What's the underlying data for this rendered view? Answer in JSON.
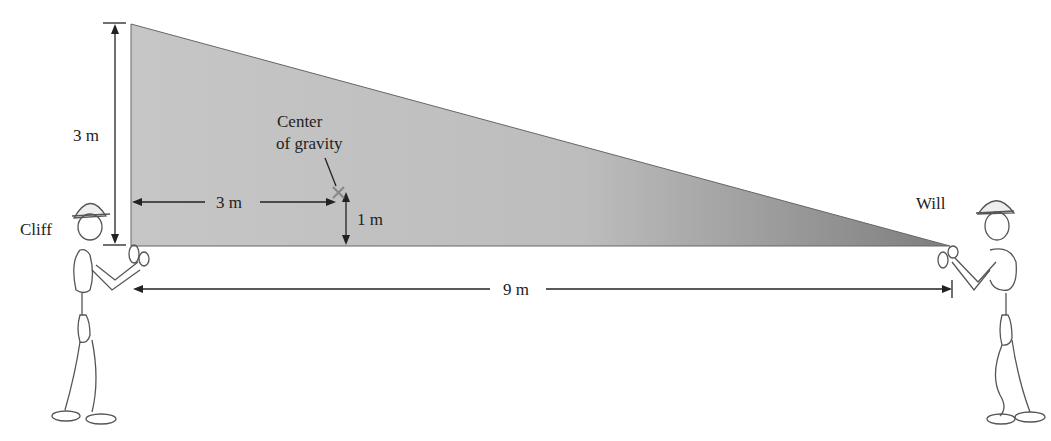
{
  "diagram": {
    "type": "physics-free-body",
    "object": "right-triangle-plate",
    "labels": {
      "height": "3 m",
      "cg_horizontal": "3 m",
      "cg_vertical": "1 m",
      "base": "9 m",
      "cg_title_line1": "Center",
      "cg_title_line2": "of gravity",
      "person_left": "Cliff",
      "person_right": "Will"
    },
    "colors": {
      "plate_light": "#c9c9c9",
      "plate_dark": "#8a8a8a",
      "ink": "#222222",
      "cg_marker": "#888888"
    }
  }
}
